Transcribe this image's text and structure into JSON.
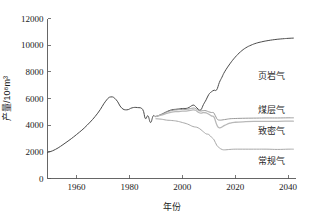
{
  "chart_data": {
    "type": "line",
    "title": "",
    "xlabel": "年份",
    "ylabel": "产量/10⁸m³",
    "xlim": [
      1949,
      2043
    ],
    "ylim": [
      0,
      12000
    ],
    "xticks": [
      1960,
      1980,
      2000,
      2020,
      2040
    ],
    "xtick_labels": [
      "1960",
      "1980",
      "2000",
      "2020",
      "2040"
    ],
    "yticks": [
      0,
      2000,
      4000,
      6000,
      8000,
      10000,
      12000
    ],
    "ytick_labels": [
      "0",
      "2000",
      "4000",
      "6000",
      "8000",
      "10000",
      "12000"
    ],
    "grid": false,
    "legend_position": "right-inline-annotations",
    "series": [
      {
        "name": "页岩气",
        "label": "页岩气",
        "color": "#4a4a4a",
        "width": 1.0,
        "x": [
          1949,
          1952,
          1956,
          1960,
          1964,
          1968,
          1971,
          1973,
          1975,
          1977,
          1979,
          1981,
          1983,
          1985,
          1986,
          1987,
          1988,
          1989,
          1990,
          1992,
          1994,
          1996,
          1998,
          2000,
          2002,
          2004,
          2005,
          2006,
          2007,
          2008,
          2009,
          2010,
          2011,
          2012,
          2013,
          2014,
          2015,
          2016,
          2018,
          2020,
          2022,
          2024,
          2026,
          2028,
          2030,
          2032,
          2035,
          2038,
          2040,
          2042
        ],
        "y": [
          1950,
          2180,
          2700,
          3300,
          4000,
          4900,
          5800,
          6120,
          5900,
          5300,
          5150,
          5300,
          5320,
          5180,
          4500,
          4700,
          4200,
          4700,
          4650,
          4800,
          5000,
          5150,
          5200,
          5250,
          5280,
          5500,
          5400,
          5200,
          5150,
          5550,
          5900,
          6300,
          6500,
          6620,
          6650,
          7200,
          7600,
          8000,
          8600,
          9100,
          9500,
          9800,
          10000,
          10150,
          10250,
          10330,
          10420,
          10480,
          10510,
          10530
        ]
      },
      {
        "name": "煤层气",
        "label": "煤层气",
        "color": "#9a9a9a",
        "width": 1.0,
        "x": [
          1990,
          1992,
          1994,
          1996,
          1998,
          2000,
          2002,
          2004,
          2005,
          2006,
          2007,
          2008,
          2009,
          2010,
          2011,
          2012,
          2013,
          2014,
          2016,
          2018,
          2020,
          2024,
          2028,
          2032,
          2036,
          2040,
          2042
        ],
        "y": [
          4650,
          4800,
          4980,
          5100,
          5150,
          5180,
          5200,
          5280,
          5250,
          5120,
          5060,
          5100,
          5080,
          5000,
          4950,
          4900,
          4500,
          4380,
          4420,
          4480,
          4500,
          4520,
          4530,
          4540,
          4540,
          4550,
          4550
        ]
      },
      {
        "name": "致密气",
        "label": "致密气",
        "color": "#b8b8b8",
        "width": 1.3,
        "x": [
          1990,
          1992,
          1994,
          1996,
          1998,
          2000,
          2002,
          2004,
          2005,
          2006,
          2007,
          2008,
          2009,
          2010,
          2011,
          2012,
          2013,
          2014,
          2016,
          2018,
          2020,
          2024,
          2028,
          2032,
          2036,
          2040,
          2042
        ],
        "y": [
          4650,
          4750,
          4880,
          4980,
          5020,
          5050,
          5080,
          5150,
          5120,
          4980,
          4900,
          4950,
          4920,
          4820,
          4700,
          4600,
          4050,
          3800,
          3980,
          4150,
          4220,
          4260,
          4280,
          4290,
          4290,
          4300,
          4300
        ]
      },
      {
        "name": "常规气",
        "label": "常规气",
        "color": "#a8a8a8",
        "width": 1.0,
        "x": [
          1990,
          1992,
          1994,
          1996,
          1998,
          2000,
          2002,
          2004,
          2006,
          2008,
          2009,
          2010,
          2011,
          2012,
          2013,
          2014,
          2015,
          2016,
          2018,
          2020,
          2024,
          2028,
          2032,
          2036,
          2040,
          2042
        ],
        "y": [
          4480,
          4450,
          4380,
          4350,
          4300,
          4200,
          4080,
          3900,
          3800,
          3500,
          3350,
          3300,
          3100,
          2900,
          2500,
          2300,
          2180,
          2150,
          2180,
          2200,
          2200,
          2200,
          2200,
          2180,
          2200,
          2200
        ]
      }
    ],
    "annotations": [
      {
        "text": "页岩气",
        "x_px": 258,
        "y_px": 79
      },
      {
        "text": "煤层气",
        "x_px": 258,
        "y_px": 113
      },
      {
        "text": "致密气",
        "x_px": 258,
        "y_px": 134
      },
      {
        "text": "常规气",
        "x_px": 258,
        "y_px": 164
      }
    ]
  }
}
